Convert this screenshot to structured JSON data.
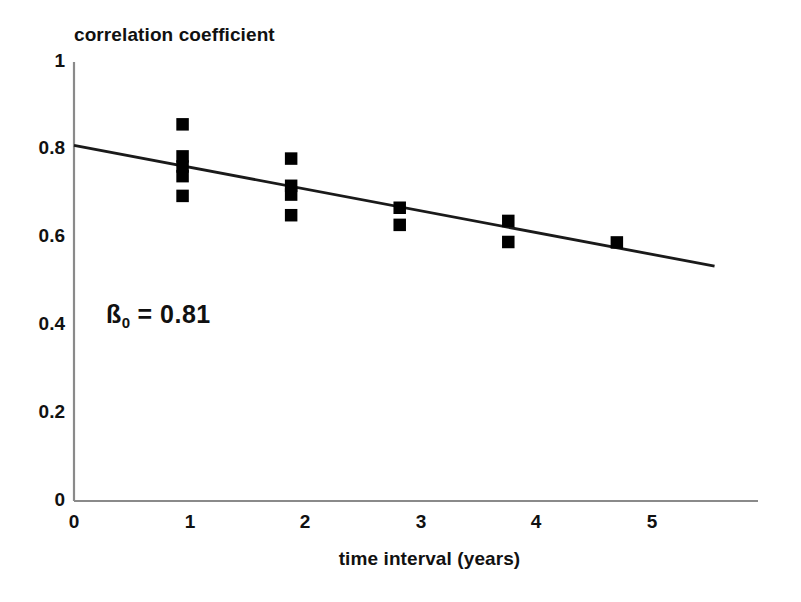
{
  "chart_data": {
    "type": "scatter",
    "title": "",
    "xlabel": "time interval (years)",
    "ylabel": "correlation coefficient",
    "xlim": [
      0,
      6.3
    ],
    "ylim": [
      0,
      1
    ],
    "grid": false,
    "legend": "none",
    "xticks": [
      "0",
      "1",
      "2",
      "3",
      "4",
      "5"
    ],
    "xtick_values": [
      0,
      1,
      2,
      3,
      4,
      5
    ],
    "yticks": [
      "0",
      "0.2",
      "0.4",
      "0.6",
      "0.8",
      "1"
    ],
    "ytick_values": [
      0,
      0.2,
      0.4,
      0.6,
      0.8,
      1
    ],
    "marker": "filled-square",
    "marker_color": "#000000",
    "axis_color": "#8a8a8a",
    "line_color": "#1a1a1a",
    "points": [
      {
        "x": 1,
        "y": 0.858
      },
      {
        "x": 1,
        "y": 0.785
      },
      {
        "x": 1,
        "y": 0.762
      },
      {
        "x": 1,
        "y": 0.74
      },
      {
        "x": 1,
        "y": 0.695
      },
      {
        "x": 2,
        "y": 0.78
      },
      {
        "x": 2,
        "y": 0.718
      },
      {
        "x": 2,
        "y": 0.698
      },
      {
        "x": 2,
        "y": 0.651
      },
      {
        "x": 3,
        "y": 0.668
      },
      {
        "x": 3,
        "y": 0.629
      },
      {
        "x": 4,
        "y": 0.638
      },
      {
        "x": 4,
        "y": 0.59
      },
      {
        "x": 5,
        "y": 0.589
      }
    ],
    "series": [
      {
        "name": "regression line",
        "type": "line",
        "x": [
          0,
          5.9
        ],
        "y": [
          0.81,
          0.535
        ],
        "slope": -0.0466,
        "intercept": 0.81
      }
    ],
    "annotations": [
      {
        "name": "beta-intercept",
        "text_prefix": "ß",
        "text_subscript": "0",
        "text_suffix": " = 0.81",
        "x": 0.28,
        "y": 0.44
      }
    ]
  }
}
